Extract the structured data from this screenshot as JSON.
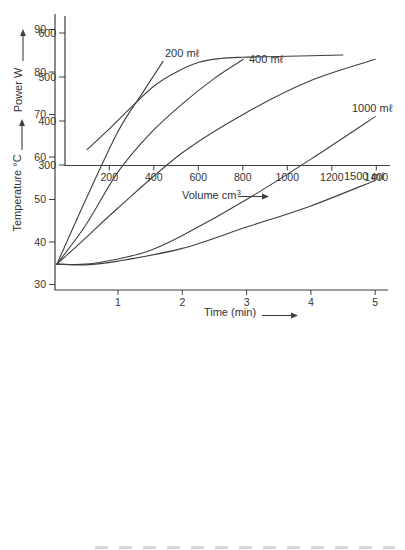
{
  "page": {
    "background": "#ffffff",
    "ink": "#3f3f3f",
    "text_color": "#333333"
  },
  "chart_data": [
    {
      "id": "temperature-vs-time",
      "type": "line",
      "title": "",
      "xlabel": "Time (min)",
      "ylabel": "Temperature °C",
      "xlim": [
        0,
        5.2
      ],
      "ylim": [
        30,
        92
      ],
      "xticks": [
        1,
        2,
        3,
        4,
        5
      ],
      "yticks": [
        90,
        80,
        70,
        60,
        50,
        40,
        30
      ],
      "grid": false,
      "legend_position": "inline-curve-labels",
      "series": [
        {
          "label": "200 mℓ",
          "points": [
            [
              0.05,
              34.8
            ],
            [
              0.5,
              50
            ],
            [
              1,
              66
            ],
            [
              1.4,
              75.5
            ],
            [
              1.7,
              82.5
            ]
          ]
        },
        {
          "label": "400 mℓ",
          "points": [
            [
              0.05,
              34.8
            ],
            [
              0.5,
              44
            ],
            [
              1,
              56.5
            ],
            [
              1.5,
              65.5
            ],
            [
              2,
              72.5
            ],
            [
              2.5,
              78.5
            ],
            [
              2.95,
              83
            ]
          ]
        },
        {
          "label": "",
          "points": [
            [
              0.05,
              34.8
            ],
            [
              0.5,
              41
            ],
            [
              1,
              48
            ],
            [
              2,
              61
            ],
            [
              3,
              70.5
            ],
            [
              4,
              78
            ],
            [
              5,
              83
            ]
          ]
        },
        {
          "label": "1000 mℓ",
          "points": [
            [
              0.05,
              34.8
            ],
            [
              0.5,
              34.8
            ],
            [
              1,
              36
            ],
            [
              1.5,
              38
            ],
            [
              2,
              41.5
            ],
            [
              3,
              50
            ],
            [
              4,
              59.5
            ],
            [
              5,
              69.5
            ]
          ]
        },
        {
          "label": "1500 mℓ",
          "points": [
            [
              0.05,
              34.8
            ],
            [
              0.5,
              34.6
            ],
            [
              1,
              35.5
            ],
            [
              2,
              38.5
            ],
            [
              3,
              43.5
            ],
            [
              4,
              48.5
            ],
            [
              5,
              54.5
            ]
          ]
        }
      ]
    },
    {
      "id": "power-vs-volume",
      "type": "line",
      "title": "",
      "xlabel": "Volume cm",
      "xlabel_sup": "3",
      "ylabel": "Power W",
      "xlim": [
        0,
        1460
      ],
      "ylim": [
        300,
        625
      ],
      "xticks": [
        200,
        400,
        600,
        800,
        1000,
        1200,
        1400
      ],
      "yticks": [
        600,
        500,
        400,
        300
      ],
      "grid": false,
      "series": [
        {
          "label": "",
          "points": [
            [
              100,
              335
            ],
            [
              200,
              382
            ],
            [
              300,
              432
            ],
            [
              400,
              479
            ],
            [
              500,
              511
            ],
            [
              600,
              533
            ],
            [
              700,
              542
            ],
            [
              800,
              545
            ],
            [
              1000,
              547
            ],
            [
              1250,
              550
            ]
          ]
        }
      ]
    }
  ]
}
